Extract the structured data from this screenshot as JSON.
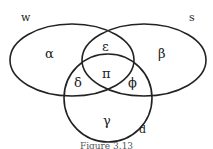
{
  "diagram": {
    "type": "venn",
    "sets": [
      {
        "name": "w",
        "shape": "ellipse"
      },
      {
        "name": "s",
        "shape": "ellipse"
      },
      {
        "name": "d",
        "shape": "circle"
      }
    ],
    "regions": {
      "w_only": "α",
      "s_only": "β",
      "d_only": "γ",
      "w_d": "δ",
      "w_s": "ε",
      "s_d": "ϕ",
      "w_s_d": "π"
    },
    "caption": "Figure 3.13"
  }
}
